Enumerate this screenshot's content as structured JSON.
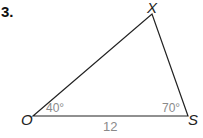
{
  "problem": {
    "number": "3."
  },
  "triangle": {
    "vertices": {
      "top": "X",
      "left": "O",
      "right": "S"
    },
    "angles": {
      "O": "40°",
      "S": "70°"
    },
    "sides": {
      "OS": "12"
    },
    "line_color": "#222222",
    "label_color": "#8a8a8a"
  }
}
